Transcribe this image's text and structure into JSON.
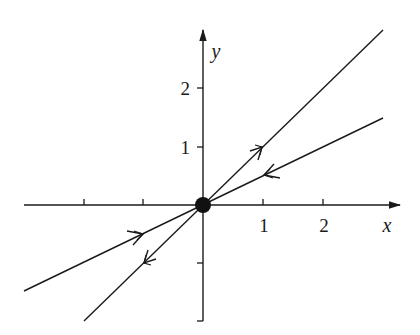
{
  "figure": {
    "colors": {
      "ink": "#1a1a1a",
      "background": "#ffffff"
    }
  },
  "axes": {
    "x": {
      "label": "x",
      "ticks": [
        -3,
        -2,
        -1,
        1,
        2
      ],
      "tick_labels": {
        "1": "1",
        "2": "2"
      },
      "range": [
        -3,
        3.3
      ]
    },
    "y": {
      "label": "y",
      "ticks": [
        -2,
        -1,
        1,
        2
      ],
      "tick_labels": {
        "1": "1",
        "2": "2"
      },
      "range": [
        -2,
        2.9
      ]
    },
    "labels": {
      "x": "x",
      "y": "y",
      "x1": "1",
      "x2": "2",
      "y1": "1",
      "y2": "2"
    }
  },
  "equilibrium": {
    "name": "origin",
    "x": 0,
    "y": 0,
    "style": "filled-dot"
  },
  "lines": [
    {
      "name": "steep-line",
      "equation": "y = x",
      "slope": 1,
      "direction": "away-from-origin",
      "x_range": [
        -2,
        3
      ]
    },
    {
      "name": "shallow-line",
      "equation": "y = x/2",
      "slope": 0.5,
      "direction": "toward-origin",
      "x_range": [
        -3,
        3
      ]
    }
  ]
}
